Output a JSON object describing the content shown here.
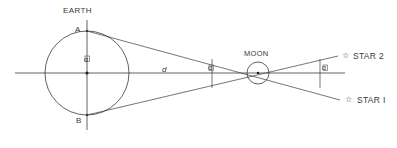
{
  "figure": {
    "title_labels": {
      "earth": "EARTH",
      "moon": "MOON",
      "point_a": "A",
      "point_b": "B",
      "distance": "d",
      "angle_earth": "α",
      "angle_moon_left": "α",
      "angle_moon_right": "α",
      "star_2": "STAR 2",
      "star_1": "STAR I",
      "star_glyph_2": "☆",
      "star_glyph_1": "☆"
    },
    "colors": {
      "stroke": "#3a3a3a",
      "background": "#ffffff",
      "text": "#3a3a3a"
    },
    "geometry": {
      "earth_center_x": 87,
      "earth_center_y": 73,
      "earth_radius": 42,
      "moon_center_x": 258,
      "moon_center_y": 73,
      "moon_radius": 11,
      "axis_start_x": 15,
      "axis_end_x": 345,
      "axis_y": 73,
      "vertical_axis_top_y": 20,
      "vertical_axis_bottom_y": 128,
      "star2_end_x": 338,
      "star2_end_y": 56,
      "star1_end_x": 340,
      "star1_end_y": 100,
      "tick_left_x": 212,
      "tick_right_x": 320
    }
  }
}
